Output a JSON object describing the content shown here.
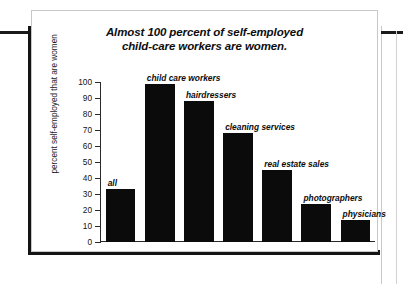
{
  "chart_data": {
    "type": "bar",
    "title": "Almost 100 percent of self-employed child-care workers are women.",
    "title_line1": "Almost 100 percent of self-employed",
    "title_line2": "child-care workers are women.",
    "xlabel": "",
    "ylabel": "percent self-employed that are women",
    "ylim": [
      0,
      100
    ],
    "ytick_step": 10,
    "grid": false,
    "legend": "none",
    "categories": [
      "all",
      "child care workers",
      "hairdressers",
      "cleaning services",
      "real estate sales",
      "photographers",
      "physicians"
    ],
    "values": [
      33,
      99,
      88,
      68,
      45,
      24,
      14
    ],
    "ytick_labels": [
      "100",
      "90",
      "80",
      "70",
      "60",
      "50",
      "40",
      "30",
      "20",
      "10",
      "0"
    ],
    "bar_color": "#0b0b0b"
  },
  "colors": {
    "background": "#ffffff",
    "card_border": "#c8c8c8",
    "axis": "#2a2a2a",
    "text": "#0d0d0d",
    "rule_black": "#141414",
    "rule_gray": "#c9c9c9"
  }
}
